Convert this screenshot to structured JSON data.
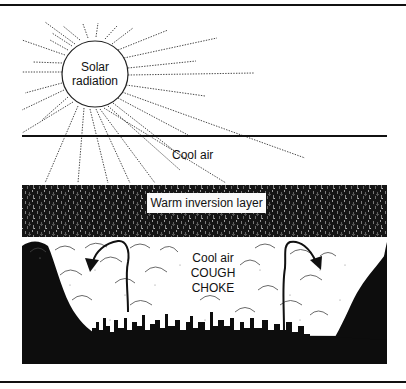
{
  "diagram": {
    "type": "illustration",
    "topic": "Temperature inversion trapping smog over a valley city",
    "labels": {
      "sun": [
        "Solar",
        "radiation"
      ],
      "upper_air": "Cool air",
      "inversion": "Warm inversion layer",
      "trapped_air": [
        "Cool air",
        "COUGH",
        "CHOKE"
      ]
    },
    "elements": [
      {
        "id": "sun",
        "shape": "circle",
        "label": "Solar radiation"
      },
      {
        "id": "rays",
        "shape": "dotted-lines",
        "count": 30
      },
      {
        "id": "ground-line",
        "shape": "horizontal-line"
      },
      {
        "id": "inversion-layer",
        "shape": "textured-band",
        "label": "Warm inversion layer"
      },
      {
        "id": "valley",
        "shape": "black-silhouette"
      },
      {
        "id": "smog",
        "shape": "cloud-puffs"
      },
      {
        "id": "city-skyline",
        "shape": "silhouette"
      },
      {
        "id": "circulation-arrow-left",
        "direction": "up-then-down-left"
      },
      {
        "id": "circulation-arrow-right",
        "direction": "up-then-down-right"
      }
    ],
    "colors": {
      "ink": "#111111",
      "background": "#ffffff",
      "label_box": "#fbfbfb"
    }
  }
}
